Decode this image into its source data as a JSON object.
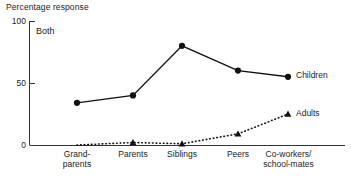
{
  "chart_data": {
    "type": "line",
    "title": "",
    "ylabel": "Percentage response",
    "xlabel": "",
    "annotation": "Both",
    "ylim": [
      0,
      100
    ],
    "yticks": [
      0,
      50,
      100
    ],
    "ytick_labels": [
      "0",
      "50",
      "100"
    ],
    "grid": false,
    "legend_position": "right-of-line-end",
    "categories": [
      "Grand-\nparents",
      "Parents",
      "Siblings",
      "Peers",
      "Co-workers/\nschool-mates"
    ],
    "series": [
      {
        "name": "Children",
        "values": [
          34,
          40,
          80,
          60,
          55
        ],
        "line_style": "solid",
        "marker": "circle",
        "color": "#111111"
      },
      {
        "name": "Adults",
        "values": [
          0,
          2,
          1,
          9,
          25
        ],
        "line_style": "dotted",
        "marker": "triangle",
        "color": "#111111"
      }
    ]
  },
  "labels": {
    "y_axis_title": "Percentage response",
    "panel_tag": "Both",
    "ytick_100": "100",
    "ytick_50": "50",
    "ytick_0": "0",
    "xtick_0": "Grand-\nparents",
    "xtick_1": "Parents",
    "xtick_2": "Siblings",
    "xtick_3": "Peers",
    "xtick_4": "Co-workers/\nschool-mates",
    "series_children": "Children",
    "series_adults": "Adults"
  }
}
